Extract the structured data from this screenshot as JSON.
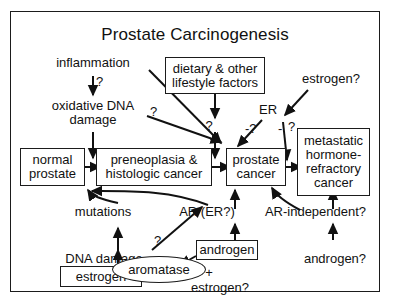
{
  "diagram": {
    "title": "Prostate Carcinogenesis",
    "type": "flowchart",
    "frame": {
      "border_color": "#1b1b1b",
      "background": "#ffffff"
    },
    "nodes": [
      {
        "id": "dietary",
        "label": "dietary & other\nlifestyle factors",
        "shape": "box"
      },
      {
        "id": "normal",
        "label": "normal\nprostate",
        "shape": "box"
      },
      {
        "id": "preneoplasia",
        "label": "preneoplasia &\nhistologic cancer",
        "shape": "box"
      },
      {
        "id": "prostate",
        "label": "prostate\ncancer",
        "shape": "box"
      },
      {
        "id": "metastatic",
        "label": "metastatic\nhormone-\nrefractory\ncancer",
        "shape": "box"
      },
      {
        "id": "androgen_box",
        "label": "androgen",
        "shape": "box"
      },
      {
        "id": "estrogen_box",
        "label": "estrogen",
        "shape": "box"
      },
      {
        "id": "aromatase",
        "label": "aromatase",
        "shape": "ellipse"
      }
    ],
    "free_text": [
      {
        "id": "inflammation",
        "label": "inflammation"
      },
      {
        "id": "oxidative",
        "label": "oxidative DNA\ndamage"
      },
      {
        "id": "estrogen_q_top",
        "label": "estrogen?"
      },
      {
        "id": "er",
        "label": "ER"
      },
      {
        "id": "mutations",
        "label": "mutations"
      },
      {
        "id": "dna_damage",
        "label": "DNA damage"
      },
      {
        "id": "ar_er",
        "label": "AR (ER?)"
      },
      {
        "id": "ar_independent",
        "label": "AR-independent?"
      },
      {
        "id": "androgen_q",
        "label": "androgen?"
      },
      {
        "id": "plus",
        "label": "+"
      },
      {
        "id": "estrogen_q_bottom",
        "label": "estrogen?"
      }
    ],
    "question_marks": [
      {
        "id": "q-inflammation",
        "label": "?"
      },
      {
        "id": "q-oxidative-diag",
        "label": "?"
      },
      {
        "id": "q-dietary",
        "label": "?"
      },
      {
        "id": "q-er-left",
        "label": "-?"
      },
      {
        "id": "q-er-right",
        "label": "-"
      },
      {
        "id": "q-er-right2",
        "label": "?"
      },
      {
        "id": "q-aromatase-diag",
        "label": "?"
      }
    ]
  }
}
